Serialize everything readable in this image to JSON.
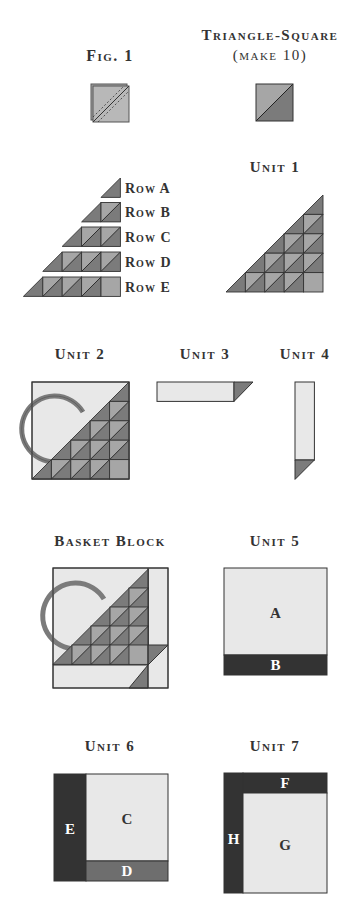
{
  "colors": {
    "light": "#e8e8e8",
    "medium": "#a6a6a6",
    "dark": "#7b7b7b",
    "darkest": "#333333",
    "band_d": "#6e6e6e",
    "outline": "#333333",
    "text": "#333333"
  },
  "labels": {
    "fig1": "Fig. 1",
    "triangle_square_line1": "Triangle-Square",
    "triangle_square_line2": "(make 10)",
    "unit1": "Unit 1",
    "unit2": "Unit 2",
    "unit3": "Unit 3",
    "unit4": "Unit 4",
    "basket_block": "Basket Block",
    "unit5": "Unit 5",
    "unit6": "Unit 6",
    "unit7": "Unit 7"
  },
  "rows": [
    {
      "label": "Row A"
    },
    {
      "label": "Row B"
    },
    {
      "label": "Row C"
    },
    {
      "label": "Row D"
    },
    {
      "label": "Row E"
    }
  ],
  "pieces": {
    "unit5": {
      "a": "A",
      "b": "B"
    },
    "unit6": {
      "c": "C",
      "d": "D",
      "e": "E"
    },
    "unit7": {
      "f": "F",
      "g": "G",
      "h": "H"
    }
  }
}
